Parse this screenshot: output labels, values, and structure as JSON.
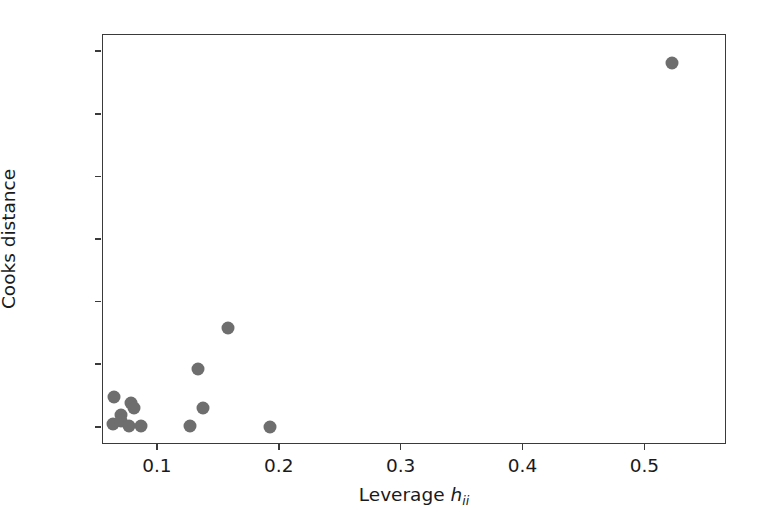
{
  "chart_data": {
    "type": "scatter",
    "title": "",
    "xlabel": "Leverage h_ii",
    "xlabel_base": "Leverage ",
    "xlabel_symbol": "h",
    "xlabel_subscript": "ii",
    "ylabel": "Cooks distance",
    "xlim": [
      0.055,
      0.567
    ],
    "ylim": [
      -0.055,
      1.255
    ],
    "xticks": [
      0.1,
      0.2,
      0.3,
      0.4,
      0.5
    ],
    "xticklabels": [
      "0.1",
      "0.2",
      "0.3",
      "0.4",
      "0.5"
    ],
    "yticks": [
      0.0,
      0.2,
      0.4,
      0.6,
      0.8,
      1.0,
      1.2
    ],
    "yticklabels": [
      "0.0",
      "0.2",
      "0.4",
      "0.6",
      "0.8",
      "1.0",
      "1.2"
    ],
    "grid": false,
    "legend": null,
    "marker_color": "#6e6e6e",
    "marker_size": 13,
    "axes_color": "#3a3a3a",
    "background": "#ffffff",
    "points": [
      {
        "x": 0.0644,
        "y": 0.099
      },
      {
        "x": 0.0776,
        "y": 0.078
      },
      {
        "x": 0.0694,
        "y": 0.04
      },
      {
        "x": 0.0628,
        "y": 0.012
      },
      {
        "x": 0.0699,
        "y": 0.022
      },
      {
        "x": 0.0805,
        "y": 0.062
      },
      {
        "x": 0.0763,
        "y": 0.006
      },
      {
        "x": 0.0862,
        "y": 0.006
      },
      {
        "x": 0.1575,
        "y": 0.319
      },
      {
        "x": 0.1329,
        "y": 0.189
      },
      {
        "x": 0.137,
        "y": 0.062
      },
      {
        "x": 0.1263,
        "y": 0.006
      },
      {
        "x": 0.192,
        "y": 0.003
      },
      {
        "x": 0.5215,
        "y": 1.165
      }
    ]
  }
}
